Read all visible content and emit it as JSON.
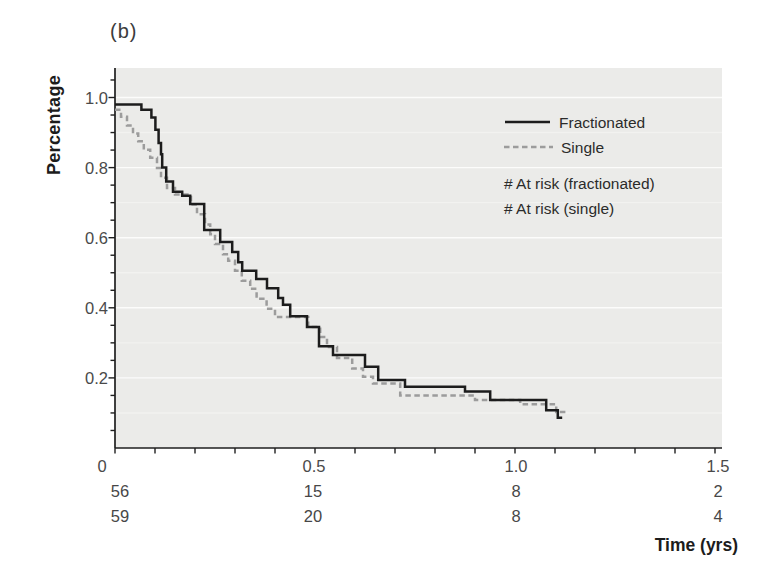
{
  "panel_label": "(b)",
  "colors": {
    "plot_background": "#ebebe9",
    "gridline": "#ffffff",
    "axis": "#1f1f1f",
    "tick_label": "#4a4a4a",
    "fractionated_curve": "#1c1c1c",
    "single_curve": "#9c9c9c"
  },
  "chart_data": {
    "type": "line",
    "subtype": "kaplan-meier-step",
    "title": "",
    "xlabel": "Time (yrs)",
    "ylabel": "Percentage",
    "xlim": [
      0,
      1.5
    ],
    "ylim": [
      0,
      1.08
    ],
    "grid": "horizontal-white-on-gray",
    "x_ticks": [
      0,
      0.5,
      1.0,
      1.5
    ],
    "x_tick_labels": [
      "0",
      "0.5",
      "1.0",
      "1.5"
    ],
    "x_minor_tick_step": 0.1,
    "y_ticks": [
      0.2,
      0.4,
      0.6,
      0.8,
      1.0
    ],
    "y_tick_labels": [
      "0.2",
      "0.4",
      "0.6",
      "0.8",
      "1.0"
    ],
    "y_minor_tick_step": 0.05,
    "legend": {
      "position": "upper-right-inside",
      "entries": [
        "Fractionated",
        "Single"
      ]
    },
    "series": [
      {
        "name": "Fractionated",
        "style": "solid",
        "color": "#1c1c1c",
        "t_end": 1.118,
        "steps": [
          [
            0,
            0.98
          ],
          [
            0.066,
            0.965
          ],
          [
            0.091,
            0.943
          ],
          [
            0.101,
            0.908
          ],
          [
            0.109,
            0.87
          ],
          [
            0.115,
            0.838
          ],
          [
            0.118,
            0.8
          ],
          [
            0.128,
            0.76
          ],
          [
            0.145,
            0.731
          ],
          [
            0.168,
            0.72
          ],
          [
            0.188,
            0.696
          ],
          [
            0.223,
            0.622
          ],
          [
            0.263,
            0.588
          ],
          [
            0.293,
            0.559
          ],
          [
            0.308,
            0.53
          ],
          [
            0.318,
            0.506
          ],
          [
            0.353,
            0.482
          ],
          [
            0.38,
            0.456
          ],
          [
            0.408,
            0.428
          ],
          [
            0.42,
            0.409
          ],
          [
            0.438,
            0.376
          ],
          [
            0.48,
            0.345
          ],
          [
            0.51,
            0.29
          ],
          [
            0.545,
            0.265
          ],
          [
            0.625,
            0.232
          ],
          [
            0.658,
            0.194
          ],
          [
            0.725,
            0.175
          ],
          [
            0.875,
            0.161
          ],
          [
            0.938,
            0.137
          ],
          [
            1.078,
            0.108
          ],
          [
            1.107,
            0.086
          ]
        ]
      },
      {
        "name": "Single",
        "style": "dashed",
        "color": "#9c9c9c",
        "t_end": 1.128,
        "steps": [
          [
            0,
            0.965
          ],
          [
            0.015,
            0.945
          ],
          [
            0.03,
            0.92
          ],
          [
            0.045,
            0.897
          ],
          [
            0.058,
            0.875
          ],
          [
            0.072,
            0.851
          ],
          [
            0.088,
            0.828
          ],
          [
            0.105,
            0.799
          ],
          [
            0.115,
            0.771
          ],
          [
            0.13,
            0.742
          ],
          [
            0.15,
            0.723
          ],
          [
            0.19,
            0.695
          ],
          [
            0.205,
            0.667
          ],
          [
            0.225,
            0.638
          ],
          [
            0.238,
            0.61
          ],
          [
            0.25,
            0.582
          ],
          [
            0.27,
            0.553
          ],
          [
            0.283,
            0.534
          ],
          [
            0.3,
            0.506
          ],
          [
            0.317,
            0.477
          ],
          [
            0.338,
            0.454
          ],
          [
            0.354,
            0.426
          ],
          [
            0.379,
            0.397
          ],
          [
            0.4,
            0.374
          ],
          [
            0.483,
            0.345
          ],
          [
            0.513,
            0.317
          ],
          [
            0.53,
            0.288
          ],
          [
            0.555,
            0.257
          ],
          [
            0.593,
            0.227
          ],
          [
            0.62,
            0.203
          ],
          [
            0.645,
            0.184
          ],
          [
            0.713,
            0.15
          ],
          [
            0.9,
            0.137
          ],
          [
            1.013,
            0.125
          ],
          [
            1.103,
            0.103
          ]
        ]
      }
    ],
    "at_risk": {
      "header_fractionated": "# At risk (fractionated)",
      "header_single": "# At risk (single)",
      "times": [
        0,
        0.5,
        1.0,
        1.5
      ],
      "fractionated": [
        "56",
        "15",
        "8",
        "2"
      ],
      "single": [
        "59",
        "20",
        "8",
        "4"
      ]
    }
  }
}
